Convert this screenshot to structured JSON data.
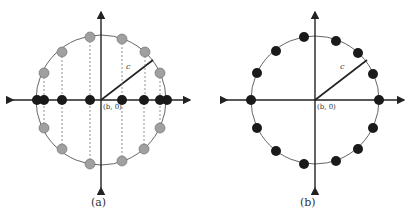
{
  "panels": [
    {
      "id": "a",
      "caption": "(a)",
      "center_label": "(b, 0)",
      "radius_label": "c",
      "center": [
        101,
        100
      ],
      "radius": 65,
      "circle_points_gray": [
        [
          44,
          73
        ],
        [
          62,
          52
        ],
        [
          90,
          37
        ],
        [
          122,
          39
        ],
        [
          145,
          52
        ],
        [
          160,
          73
        ],
        [
          44,
          128
        ],
        [
          62,
          149
        ],
        [
          90,
          164
        ],
        [
          122,
          161
        ],
        [
          144,
          149
        ],
        [
          160,
          128
        ]
      ],
      "axis_points_black": [
        37,
        44,
        62,
        90,
        122,
        144,
        160,
        167
      ],
      "colors": {
        "gray_point": "#a0a0a0",
        "black_point": "#1a1a1a",
        "circle": "#555555"
      }
    },
    {
      "id": "b",
      "caption": "(b)",
      "center_label": "(b, 0)",
      "radius_label": "c",
      "center": [
        315,
        100
      ],
      "radius": 64,
      "circle_points_black": [
        [
          251,
          100
        ],
        [
          257,
          73
        ],
        [
          276,
          51
        ],
        [
          304,
          37
        ],
        [
          336,
          41
        ],
        [
          358,
          53
        ],
        [
          373,
          74
        ],
        [
          379,
          100
        ],
        [
          373,
          128
        ],
        [
          358,
          149
        ],
        [
          336,
          161
        ],
        [
          304,
          164
        ],
        [
          276,
          151
        ],
        [
          257,
          128
        ]
      ]
    }
  ]
}
